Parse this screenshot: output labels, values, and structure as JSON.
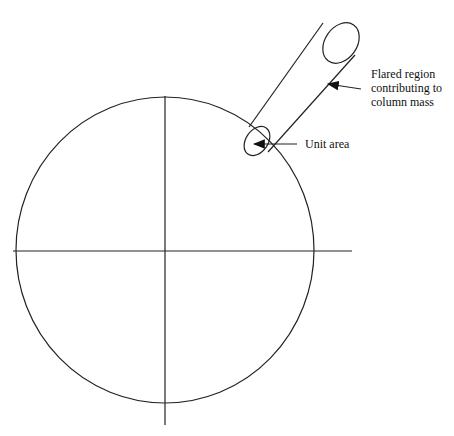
{
  "diagram": {
    "labels": {
      "flared_line1": "Flared region",
      "flared_line2": "contributing to",
      "flared_line3": "column mass",
      "unit_area": "Unit area"
    },
    "colors": {
      "stroke": "#222222",
      "background": "#ffffff"
    }
  }
}
